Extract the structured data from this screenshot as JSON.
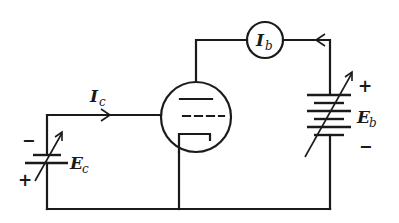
{
  "diagram": {
    "type": "vacuum-tube triode circuit",
    "labels": {
      "grid_current": {
        "main": "I",
        "sub": "c"
      },
      "plate_current_meter": {
        "main": "I",
        "sub": "b"
      },
      "grid_battery": {
        "main": "E",
        "sub": "c"
      },
      "plate_battery": {
        "main": "E",
        "sub": "b"
      }
    },
    "polarity": {
      "grid_battery_top": "−",
      "grid_battery_bottom": "+",
      "plate_battery_top": "+",
      "plate_battery_bottom": "−"
    },
    "components": [
      "triode tube (plate, grid, cathode)",
      "ammeter Ib in plate circuit",
      "variable battery Eb (plate supply)",
      "variable battery Ec (grid bias)"
    ],
    "colors": {
      "ink": "#1a1a1a",
      "background": "#ffffff"
    }
  }
}
